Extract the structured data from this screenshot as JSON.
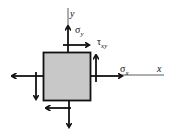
{
  "diagram": {
    "colors": {
      "element_fill": "#c8c8c8",
      "stroke": "#111111",
      "axis": "#333333"
    },
    "axes": {
      "x_label": "x",
      "y_label": "y"
    },
    "labels": {
      "sigma_y": {
        "symbol": "σ",
        "sub": "y"
      },
      "tau_xy": {
        "symbol": "τ",
        "sub": "xy"
      },
      "sigma_x": {
        "symbol": "σ",
        "sub": "x"
      }
    }
  }
}
